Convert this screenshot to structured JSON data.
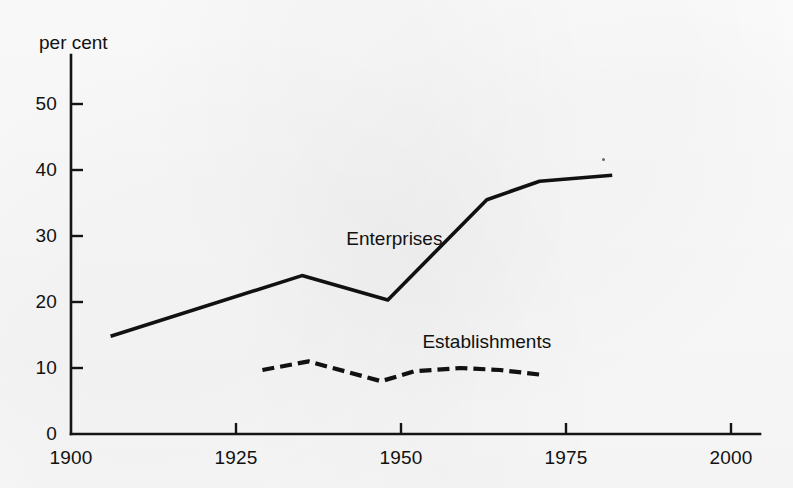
{
  "chart_data": {
    "type": "line",
    "title": "",
    "xlabel": "",
    "ylabel": "per cent",
    "ylim": [
      0,
      55
    ],
    "xlim": [
      1900,
      2005
    ],
    "grid": false,
    "legend_position": "inline-annotation",
    "x_ticks": [
      1900,
      1925,
      1950,
      1975,
      2000
    ],
    "x_tick_labels": [
      "1900",
      "1925",
      "1950",
      "1975",
      "2000"
    ],
    "y_ticks": [
      0,
      10,
      20,
      30,
      40,
      50
    ],
    "y_tick_labels": [
      "0",
      "10",
      "20",
      "30",
      "40",
      "50"
    ],
    "annotations": [
      {
        "text": "Enterprises",
        "x": 1949,
        "y": 29.5
      },
      {
        "text": "Establishments",
        "x": 1963,
        "y": 14.0
      }
    ],
    "series": [
      {
        "name": "Enterprises",
        "style": "solid",
        "color": "#111111",
        "x": [
          1906,
          1935,
          1948,
          1963,
          1971,
          1982
        ],
        "values": [
          14.8,
          24.0,
          20.3,
          35.5,
          38.3,
          39.2
        ]
      },
      {
        "name": "Establishments",
        "style": "dashed",
        "color": "#111111",
        "x": [
          1929,
          1936,
          1947,
          1952,
          1959,
          1965,
          1971
        ],
        "values": [
          9.7,
          11.0,
          8.0,
          9.5,
          10.0,
          9.7,
          9.0
        ]
      }
    ]
  },
  "axes": {
    "unit_label": "per cent"
  },
  "marks": {
    "speck": "ink-speck"
  }
}
